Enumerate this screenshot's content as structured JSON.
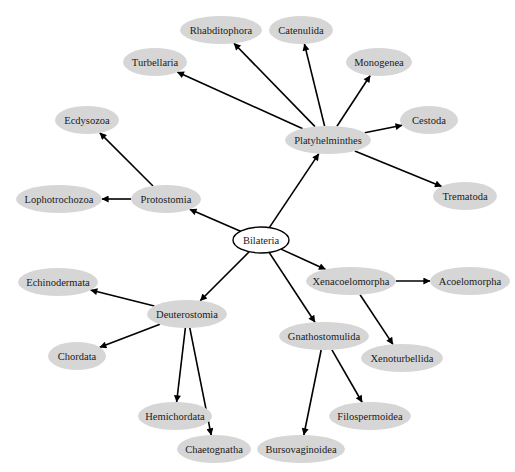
{
  "diagram": {
    "type": "directed-tree",
    "root": "Bilateria",
    "colors": {
      "node_fill": "#d6d6d6",
      "root_fill": "#ffffff",
      "root_stroke": "#000000",
      "edge": "#000000",
      "text": "#1a1a1a"
    },
    "nodes": [
      {
        "id": "Bilateria",
        "label": "Bilateria",
        "x": 261,
        "y": 240,
        "w": 56,
        "h": 26,
        "root": true
      },
      {
        "id": "Platyhelminthes",
        "label": "Platyhelminthes",
        "x": 328,
        "y": 140,
        "w": 86,
        "h": 28
      },
      {
        "id": "Protostomia",
        "label": "Protostomia",
        "x": 166,
        "y": 199,
        "w": 70,
        "h": 28
      },
      {
        "id": "Deuterostomia",
        "label": "Deuterostomia",
        "x": 187,
        "y": 314,
        "w": 80,
        "h": 28
      },
      {
        "id": "Xenacoelomorpha",
        "label": "Xenacoelomorpha",
        "x": 351,
        "y": 281,
        "w": 90,
        "h": 28
      },
      {
        "id": "Gnathostomulida",
        "label": "Gnathostomulida",
        "x": 324,
        "y": 336,
        "w": 90,
        "h": 28
      },
      {
        "id": "Rhabditophora",
        "label": "Rhabditophora",
        "x": 221,
        "y": 30,
        "w": 82,
        "h": 28
      },
      {
        "id": "Catenulida",
        "label": "Catenulida",
        "x": 301,
        "y": 30,
        "w": 64,
        "h": 28
      },
      {
        "id": "Turbellaria",
        "label": "Turbellaria",
        "x": 155,
        "y": 62,
        "w": 64,
        "h": 28
      },
      {
        "id": "Monogenea",
        "label": "Monogenea",
        "x": 379,
        "y": 62,
        "w": 66,
        "h": 28
      },
      {
        "id": "Cestoda",
        "label": "Cestoda",
        "x": 429,
        "y": 120,
        "w": 58,
        "h": 28
      },
      {
        "id": "Trematoda",
        "label": "Trematoda",
        "x": 465,
        "y": 196,
        "w": 64,
        "h": 28
      },
      {
        "id": "Ecdysozoa",
        "label": "Ecdysozoa",
        "x": 87,
        "y": 120,
        "w": 64,
        "h": 28
      },
      {
        "id": "Lophotrochozoa",
        "label": "Lophotrochozoa",
        "x": 59,
        "y": 199,
        "w": 86,
        "h": 28
      },
      {
        "id": "Echinodermata",
        "label": "Echinodermata",
        "x": 58,
        "y": 282,
        "w": 80,
        "h": 28
      },
      {
        "id": "Chordata",
        "label": "Chordata",
        "x": 77,
        "y": 356,
        "w": 58,
        "h": 28
      },
      {
        "id": "Hemichordata",
        "label": "Hemichordata",
        "x": 175,
        "y": 416,
        "w": 74,
        "h": 28
      },
      {
        "id": "Chaetognatha",
        "label": "Chaetognatha",
        "x": 214,
        "y": 449,
        "w": 74,
        "h": 28
      },
      {
        "id": "Acoelomorpha",
        "label": "Acoelomorpha",
        "x": 470,
        "y": 281,
        "w": 80,
        "h": 28
      },
      {
        "id": "Xenoturbellida",
        "label": "Xenoturbellida",
        "x": 402,
        "y": 358,
        "w": 82,
        "h": 28
      },
      {
        "id": "Filospermoidea",
        "label": "Filospermoidea",
        "x": 370,
        "y": 416,
        "w": 82,
        "h": 28
      },
      {
        "id": "Bursovaginoidea",
        "label": "Bursovaginoidea",
        "x": 301,
        "y": 449,
        "w": 88,
        "h": 28
      }
    ],
    "edges": [
      {
        "from": "Bilateria",
        "to": "Platyhelminthes"
      },
      {
        "from": "Bilateria",
        "to": "Protostomia"
      },
      {
        "from": "Bilateria",
        "to": "Deuterostomia"
      },
      {
        "from": "Bilateria",
        "to": "Xenacoelomorpha"
      },
      {
        "from": "Bilateria",
        "to": "Gnathostomulida"
      },
      {
        "from": "Platyhelminthes",
        "to": "Rhabditophora"
      },
      {
        "from": "Platyhelminthes",
        "to": "Catenulida"
      },
      {
        "from": "Platyhelminthes",
        "to": "Turbellaria"
      },
      {
        "from": "Platyhelminthes",
        "to": "Monogenea"
      },
      {
        "from": "Platyhelminthes",
        "to": "Cestoda"
      },
      {
        "from": "Platyhelminthes",
        "to": "Trematoda"
      },
      {
        "from": "Protostomia",
        "to": "Ecdysozoa"
      },
      {
        "from": "Protostomia",
        "to": "Lophotrochozoa"
      },
      {
        "from": "Deuterostomia",
        "to": "Echinodermata"
      },
      {
        "from": "Deuterostomia",
        "to": "Chordata"
      },
      {
        "from": "Deuterostomia",
        "to": "Hemichordata"
      },
      {
        "from": "Deuterostomia",
        "to": "Chaetognatha"
      },
      {
        "from": "Xenacoelomorpha",
        "to": "Acoelomorpha"
      },
      {
        "from": "Xenacoelomorpha",
        "to": "Xenoturbellida"
      },
      {
        "from": "Gnathostomulida",
        "to": "Filospermoidea"
      },
      {
        "from": "Gnathostomulida",
        "to": "Bursovaginoidea"
      }
    ]
  }
}
